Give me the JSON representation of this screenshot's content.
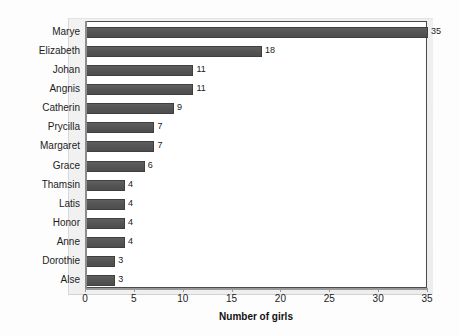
{
  "chart_data": {
    "type": "bar",
    "orientation": "horizontal",
    "title": "",
    "xlabel": "Number of girls",
    "ylabel": "",
    "xlim": [
      0,
      35
    ],
    "xticks": [
      0,
      5,
      10,
      15,
      20,
      25,
      30,
      35
    ],
    "grid": false,
    "legend": false,
    "show_value_labels": true,
    "categories": [
      "Marye",
      "Elizabeth",
      "Johan",
      "Angnis",
      "Catherin",
      "Prycilla",
      "Margaret",
      "Grace",
      "Thamsin",
      "Latis",
      "Honor",
      "Anne",
      "Dorothie",
      "Alse"
    ],
    "values": [
      35,
      18,
      11,
      11,
      9,
      7,
      7,
      6,
      4,
      4,
      4,
      4,
      3,
      3
    ],
    "value_labels": [
      "35",
      "18",
      "11",
      "11",
      "9",
      "7",
      "7",
      "6",
      "4",
      "4",
      "4",
      "4",
      "3",
      "3"
    ],
    "colors": {
      "bar_fill": "#555555",
      "bar_border": "#3f3f3f",
      "plot_background": "#ffffff",
      "chart_background": "#f0f0f0",
      "axis_line": "#4a4a4a",
      "text": "#1c1c1c"
    }
  }
}
